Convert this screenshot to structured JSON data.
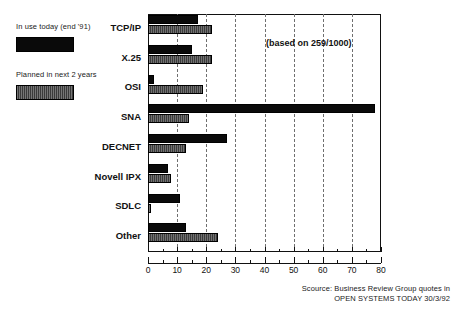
{
  "legend": {
    "entries": [
      {
        "label": "In use today (end '91)",
        "swatch": "solid-black",
        "color": "#0a0a0a"
      },
      {
        "label": "Planned in next 2 years",
        "swatch": "hatched-gray",
        "color": "#3b3b3b"
      }
    ]
  },
  "annotation": "(based on 259/1000)",
  "source": {
    "line1": "Scource: Business Review Group quotes in",
    "line2": "OPEN SYSTEMS TODAY 30/3/92"
  },
  "chart_data": {
    "type": "bar",
    "orientation": "horizontal",
    "title": "",
    "xlabel": "",
    "ylabel": "",
    "xlim": [
      0,
      80
    ],
    "xticks": [
      0,
      10,
      20,
      30,
      40,
      50,
      60,
      70,
      80
    ],
    "xtick_labels": [
      "0",
      "10",
      "20",
      "30",
      "40",
      "50",
      "60",
      "70",
      "80"
    ],
    "minor_tick_step": 5,
    "grid": "vertical-dashed",
    "legend_position": "outside-left",
    "annotations": [
      "(based on 259/1000)"
    ],
    "categories": [
      "TCP/IP",
      "X.25",
      "OSI",
      "SNA",
      "DECNET",
      "Novell IPX",
      "SDLC",
      "Other"
    ],
    "series": [
      {
        "name": "In use today (end '91)",
        "color": "#0a0a0a",
        "values": [
          17,
          15,
          2,
          78,
          27,
          7,
          11,
          13
        ]
      },
      {
        "name": "Planned in next 2 years",
        "color": "#3b3b3b",
        "values": [
          22,
          22,
          19,
          14,
          13,
          8,
          1,
          24
        ]
      }
    ]
  }
}
